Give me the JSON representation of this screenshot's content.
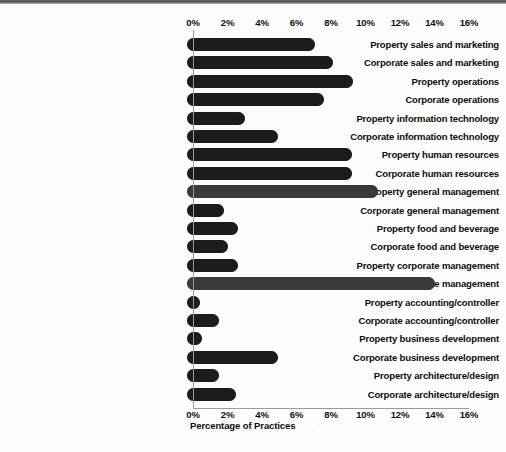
{
  "chart_data": {
    "type": "bar",
    "orientation": "horizontal",
    "title": "",
    "xlabel": "Percentage of Practices",
    "ylabel": "",
    "xlim": [
      0,
      16
    ],
    "xticks": [
      "0%",
      "2%",
      "4%",
      "6%",
      "8%",
      "10%",
      "12%",
      "14%",
      "16%"
    ],
    "xtick_values": [
      0,
      2,
      4,
      6,
      8,
      10,
      12,
      14,
      16
    ],
    "grid": false,
    "legend": false,
    "axis_top": true,
    "axis_bottom": true,
    "categories": [
      "Property sales and marketing",
      "Corporate sales and marketing",
      "Property operations",
      "Corporate operations",
      "Property information technology",
      "Corporate information technology",
      "Property human resources",
      "Corporate human resources",
      "Property general management",
      "Corporate general management",
      "Property food and beverage",
      "Corporate food and beverage",
      "Property corporate management",
      "Corporate corporate management",
      "Property accounting/controller",
      "Corporate accounting/controller",
      "Property business development",
      "Corporate business development",
      "Property architecture/design",
      "Corporate architecture/design"
    ],
    "values": [
      7.1,
      8.1,
      9.3,
      7.6,
      3.0,
      4.9,
      9.2,
      9.2,
      10.7,
      1.8,
      2.6,
      2.0,
      2.6,
      14.0,
      0.4,
      1.5,
      0.5,
      4.9,
      1.5,
      2.5
    ],
    "bar_color": "#1c1c1c"
  },
  "colors": {
    "bar": "#1c1c1c",
    "bar_light": "#3a3a3a",
    "axis": "#9a9a9a",
    "text": "#0c0c0c",
    "background": "#fdfdfd"
  }
}
